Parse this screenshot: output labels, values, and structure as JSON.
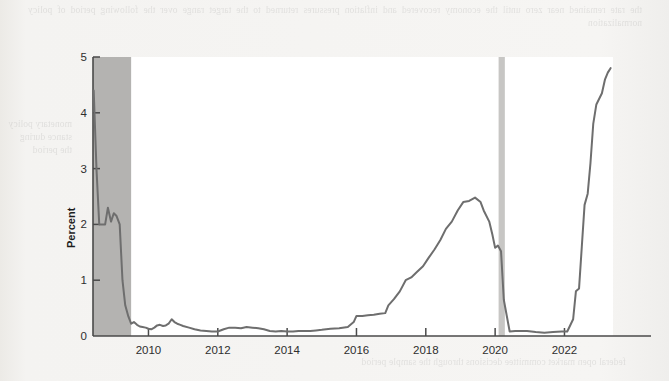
{
  "page": {
    "background_color": "#f3f2f0",
    "ghost_text_top": "the rate remained near zero until the economy recovered and inflation pressures returned to the target range over the following period of policy normalization",
    "ghost_text_left": "monetary policy stance during the period",
    "ghost_text_bottom": "federal open market committee decisions through the sample period"
  },
  "chart_data": {
    "type": "line",
    "title": "",
    "xlabel": "",
    "ylabel": "Percent",
    "ylim": [
      0,
      5
    ],
    "xlim": [
      2008.4,
      2023.4
    ],
    "grid": false,
    "legend": "none",
    "line_color": "#6e6e6e",
    "ytick_labels": [
      "0",
      "1",
      "2",
      "3",
      "4",
      "5"
    ],
    "ytick_values": [
      0,
      1,
      2,
      3,
      4,
      5
    ],
    "xtick_labels": [
      "2010",
      "2012",
      "2014",
      "2016",
      "2018",
      "2020",
      "2022"
    ],
    "xtick_values": [
      2010,
      2012,
      2014,
      2016,
      2018,
      2020,
      2022
    ],
    "shaded_regions": [
      {
        "name": "recession-2008-2009",
        "x0": 2008.4,
        "x1": 2009.5,
        "color": "#b4b3b1"
      },
      {
        "name": "recession-2020",
        "x0": 2020.1,
        "x1": 2020.28,
        "color": "#c7c6c4"
      }
    ],
    "series": [
      {
        "name": "Federal funds rate",
        "x": [
          2008.42,
          2008.5,
          2008.58,
          2008.67,
          2008.75,
          2008.83,
          2008.92,
          2009.0,
          2009.08,
          2009.17,
          2009.25,
          2009.33,
          2009.42,
          2009.5,
          2009.58,
          2009.67,
          2009.75,
          2009.83,
          2009.92,
          2010.0,
          2010.08,
          2010.17,
          2010.25,
          2010.33,
          2010.42,
          2010.5,
          2010.58,
          2010.67,
          2010.75,
          2010.83,
          2010.92,
          2011.0,
          2011.17,
          2011.33,
          2011.5,
          2011.67,
          2011.83,
          2012.0,
          2012.17,
          2012.33,
          2012.5,
          2012.67,
          2012.83,
          2013.0,
          2013.17,
          2013.33,
          2013.5,
          2013.67,
          2013.83,
          2014.0,
          2014.17,
          2014.33,
          2014.5,
          2014.67,
          2014.83,
          2015.0,
          2015.25,
          2015.5,
          2015.75,
          2015.92,
          2016.0,
          2016.17,
          2016.33,
          2016.5,
          2016.67,
          2016.83,
          2016.92,
          2017.08,
          2017.25,
          2017.42,
          2017.58,
          2017.75,
          2017.92,
          2018.08,
          2018.25,
          2018.42,
          2018.58,
          2018.75,
          2018.92,
          2019.08,
          2019.25,
          2019.42,
          2019.58,
          2019.67,
          2019.83,
          2019.92,
          2020.0,
          2020.08,
          2020.17,
          2020.25,
          2020.42,
          2020.58,
          2020.75,
          2020.92,
          2021.17,
          2021.42,
          2021.67,
          2021.92,
          2022.08,
          2022.25,
          2022.33,
          2022.42,
          2022.5,
          2022.58,
          2022.67,
          2022.75,
          2022.83,
          2022.92,
          2023.08,
          2023.17,
          2023.25,
          2023.33
        ],
        "y": [
          4.4,
          3.0,
          2.0,
          2.0,
          2.0,
          2.3,
          2.05,
          2.2,
          2.15,
          2.0,
          1.0,
          0.55,
          0.35,
          0.22,
          0.25,
          0.2,
          0.17,
          0.16,
          0.15,
          0.13,
          0.12,
          0.15,
          0.19,
          0.2,
          0.18,
          0.19,
          0.22,
          0.3,
          0.25,
          0.22,
          0.2,
          0.18,
          0.15,
          0.12,
          0.1,
          0.09,
          0.08,
          0.08,
          0.12,
          0.15,
          0.15,
          0.14,
          0.16,
          0.15,
          0.14,
          0.12,
          0.09,
          0.08,
          0.09,
          0.08,
          0.08,
          0.09,
          0.09,
          0.09,
          0.1,
          0.11,
          0.13,
          0.14,
          0.16,
          0.25,
          0.36,
          0.36,
          0.37,
          0.38,
          0.4,
          0.41,
          0.55,
          0.66,
          0.8,
          1.0,
          1.05,
          1.15,
          1.25,
          1.4,
          1.55,
          1.72,
          1.92,
          2.05,
          2.25,
          2.4,
          2.42,
          2.48,
          2.4,
          2.25,
          2.05,
          1.82,
          1.58,
          1.62,
          1.52,
          0.65,
          0.08,
          0.09,
          0.09,
          0.09,
          0.07,
          0.06,
          0.07,
          0.08,
          0.08,
          0.3,
          0.8,
          0.85,
          1.6,
          2.35,
          2.55,
          3.1,
          3.8,
          4.15,
          4.35,
          4.6,
          4.72,
          4.8
        ]
      }
    ]
  }
}
